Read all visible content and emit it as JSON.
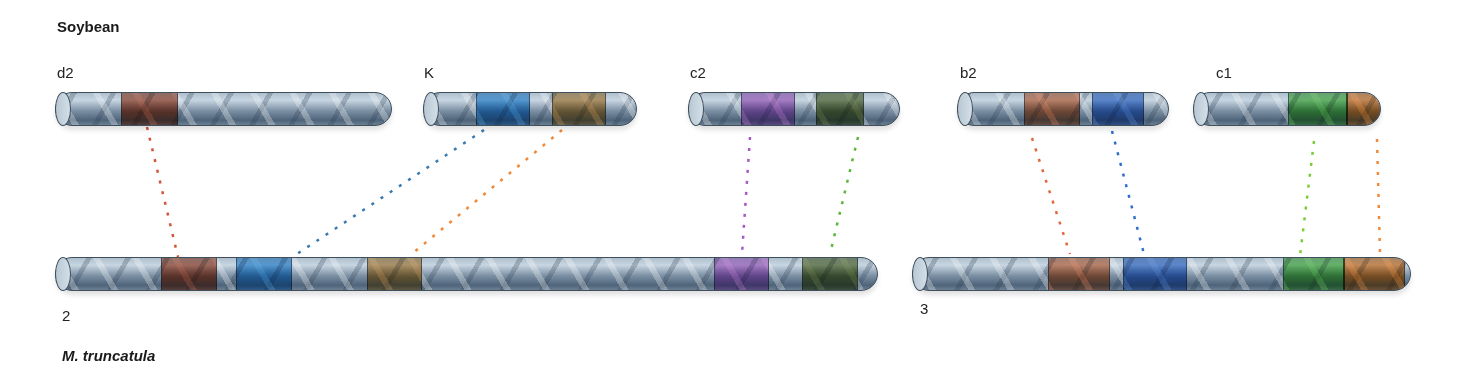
{
  "species": {
    "top": "Soybean",
    "bottom": "M. truncatula"
  },
  "colors": {
    "red_brown": "#b0462a",
    "blue": "#2f95e0",
    "orange_brown": "#c88a3c",
    "purple": "#c06ad0",
    "olive": "#5e7230",
    "salmon": "#e07040",
    "royal_blue": "#3a78d8",
    "green": "#4cc040",
    "orange": "#f47c20"
  },
  "soybean_chromosomes": [
    {
      "id": "d2",
      "label": "d2",
      "x": 55,
      "y": 92,
      "w": 337,
      "label_x": 57,
      "label_y": 64,
      "blocks": [
        {
          "x": 65,
          "w": 55,
          "color": "#b0462a"
        }
      ]
    },
    {
      "id": "K",
      "label": "K",
      "x": 423,
      "y": 92,
      "w": 214,
      "label_x": 424,
      "label_y": 64,
      "blocks": [
        {
          "x": 52,
          "w": 52,
          "color": "#2f95e0"
        },
        {
          "x": 128,
          "w": 52,
          "color": "#c88a3c"
        }
      ]
    },
    {
      "id": "c2",
      "label": "c2",
      "x": 688,
      "y": 92,
      "w": 212,
      "label_x": 690,
      "label_y": 64,
      "blocks": [
        {
          "x": 52,
          "w": 52,
          "color": "#c06ad0"
        },
        {
          "x": 127,
          "w": 46,
          "color": "#5e7230"
        }
      ]
    },
    {
      "id": "b2",
      "label": "b2",
      "x": 957,
      "y": 92,
      "w": 212,
      "label_x": 960,
      "label_y": 64,
      "blocks": [
        {
          "x": 66,
          "w": 54,
          "color": "#e07040"
        },
        {
          "x": 134,
          "w": 50,
          "color": "#3a78d8"
        }
      ]
    },
    {
      "id": "c1",
      "label": "c1",
      "x": 1193,
      "y": 92,
      "w": 188,
      "label_x": 1216,
      "label_y": 64,
      "blocks": [
        {
          "x": 94,
          "w": 58,
          "color": "#4cc040"
        },
        {
          "x": 152,
          "w": 36,
          "color": "#f47c20"
        }
      ]
    }
  ],
  "medicago_chromosomes": [
    {
      "id": "2",
      "label": "2",
      "x": 55,
      "y": 257,
      "w": 823,
      "label_x": 62,
      "label_y": 307,
      "blocks": [
        {
          "x": 105,
          "w": 54,
          "color": "#b0462a"
        },
        {
          "x": 180,
          "w": 54,
          "color": "#2f95e0"
        },
        {
          "x": 311,
          "w": 53,
          "color": "#c88a3c"
        },
        {
          "x": 658,
          "w": 53,
          "color": "#c06ad0"
        },
        {
          "x": 746,
          "w": 54,
          "color": "#5e7230"
        }
      ]
    },
    {
      "id": "3",
      "label": "3",
      "x": 912,
      "y": 257,
      "w": 499,
      "label_x": 920,
      "label_y": 300,
      "blocks": [
        {
          "x": 135,
          "w": 60,
          "color": "#e07040"
        },
        {
          "x": 210,
          "w": 62,
          "color": "#3a78d8"
        },
        {
          "x": 370,
          "w": 60,
          "color": "#4cc040"
        },
        {
          "x": 430,
          "w": 60,
          "color": "#f47c20"
        }
      ]
    }
  ],
  "links": [
    {
      "from": "d2",
      "to": "2",
      "x1": 147,
      "y1": 127,
      "x2": 178,
      "y2": 257,
      "color": "#d2553a"
    },
    {
      "from": "K",
      "to": "2",
      "x1": 484,
      "y1": 130,
      "x2": 297,
      "y2": 254,
      "color": "#3a7aae"
    },
    {
      "from": "K",
      "to": "2",
      "x1": 562,
      "y1": 130,
      "x2": 413,
      "y2": 253,
      "color": "#f08a3a"
    },
    {
      "from": "c2",
      "to": "2",
      "x1": 750,
      "y1": 137,
      "x2": 742,
      "y2": 254,
      "color": "#a558c8"
    },
    {
      "from": "c2",
      "to": "2",
      "x1": 858,
      "y1": 137,
      "x2": 830,
      "y2": 254,
      "color": "#5cb838"
    },
    {
      "from": "b2",
      "to": "3",
      "x1": 1032,
      "y1": 138,
      "x2": 1070,
      "y2": 254,
      "color": "#e06a40"
    },
    {
      "from": "b2",
      "to": "3",
      "x1": 1112,
      "y1": 131,
      "x2": 1144,
      "y2": 254,
      "color": "#2e6ec8"
    },
    {
      "from": "c1",
      "to": "3",
      "x1": 1314,
      "y1": 141,
      "x2": 1300,
      "y2": 256,
      "color": "#7acc3c"
    },
    {
      "from": "c1",
      "to": "3",
      "x1": 1377,
      "y1": 139,
      "x2": 1380,
      "y2": 254,
      "color": "#f08a3a"
    }
  ]
}
